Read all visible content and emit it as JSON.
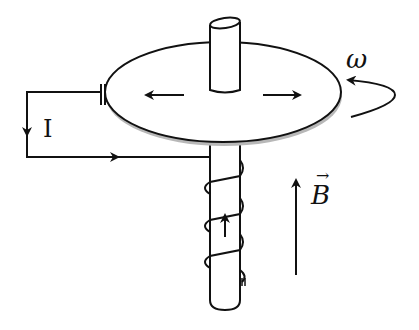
{
  "figure": {
    "labels": {
      "current": "I",
      "angular_velocity": "ω",
      "magnetic_field": "B",
      "magnetic_field_vector_mark": "→"
    },
    "colors": {
      "stroke": "#111111",
      "background": "#ffffff",
      "disk_fill": "#ffffff",
      "disk_shadow": "#b0b0b0"
    }
  }
}
